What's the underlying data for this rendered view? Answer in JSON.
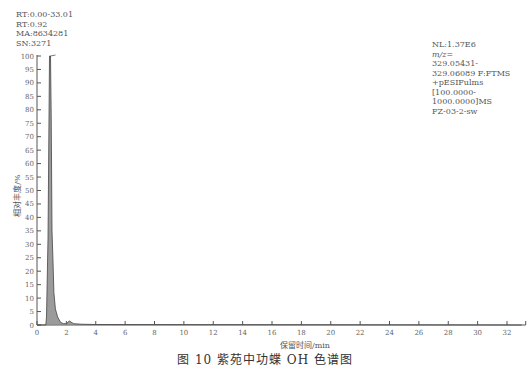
{
  "header_info": {
    "rt_range": "RT:0.00-33.01",
    "rt": "RT:0.92",
    "ma": "MA:8634281",
    "sn": "SN:3271"
  },
  "scan_info": {
    "nl": "NL:1.37E6",
    "mz_label": "m/z=",
    "mz_low": "329.05431-",
    "mz_high": "329.06089 F:FTMS",
    "mode": "+pESIFulms",
    "range_low": "[100.0000-",
    "range_high": "1000.0000]MS",
    "sample": "FZ-03-2-sw"
  },
  "caption": "图 10   紫苑中功蝶 OH 色谱图",
  "chart_data": {
    "type": "line",
    "title": "",
    "xlabel": "保留时间/min",
    "ylabel": "相对丰度/%",
    "xlim": [
      0,
      33
    ],
    "ylim": [
      0,
      100
    ],
    "x_ticks": [
      0,
      2,
      4,
      6,
      8,
      10,
      12,
      14,
      16,
      18,
      20,
      22,
      24,
      26,
      28,
      30,
      32
    ],
    "y_ticks": [
      0,
      5,
      10,
      15,
      20,
      25,
      30,
      35,
      40,
      45,
      50,
      55,
      60,
      65,
      70,
      75,
      80,
      85,
      90,
      95,
      100
    ],
    "grid": false,
    "series": [
      {
        "name": "EIC m/z 329.05431-329.06089",
        "x": [
          0,
          0.6,
          0.65,
          0.75,
          0.85,
          0.92,
          0.97,
          1.02,
          1.08,
          1.15,
          1.25,
          1.4,
          1.6,
          1.8,
          2.0,
          2.2,
          2.5,
          3.0,
          4.0,
          33.0
        ],
        "y": [
          0,
          0,
          3,
          32,
          100,
          100,
          78,
          35,
          25,
          12,
          6,
          3,
          1,
          0.5,
          0.5,
          1.5,
          0.5,
          0.3,
          0.2,
          0
        ]
      }
    ],
    "annotations": [
      "RT:0.92",
      "MA:8634281",
      "SN:3271",
      "NL:1.37E6"
    ]
  }
}
